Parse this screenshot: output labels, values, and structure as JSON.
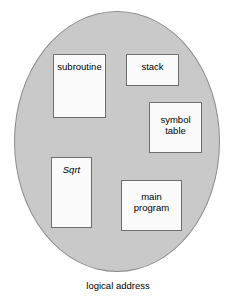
{
  "figure": {
    "caption": "logical address",
    "container_label": "logical address space oval",
    "colors": {
      "oval_fill": "#c9c9c9",
      "oval_stroke": "#8c8c8c",
      "segment_fill": "#fbfbfb",
      "segment_stroke": "#6e6e6e",
      "text": "#000000",
      "background": "#ffffff"
    }
  },
  "segments": [
    {
      "id": "subroutine",
      "label": "subroutine",
      "style": "normal"
    },
    {
      "id": "stack",
      "label": "stack",
      "style": "normal"
    },
    {
      "id": "symbol-table",
      "label": "symbol\ntable",
      "style": "normal"
    },
    {
      "id": "sqrt",
      "label": "Sqrt",
      "style": "italic"
    },
    {
      "id": "main-program",
      "label": "main\nprogram",
      "style": "normal"
    }
  ]
}
